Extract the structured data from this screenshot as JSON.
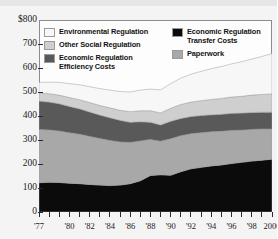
{
  "chart_data": {
    "type": "area",
    "title": "",
    "subtitle": "",
    "xlabel": "",
    "ylabel": "",
    "ylim": [
      0,
      800
    ],
    "ytick_labels": [
      "$800",
      "700",
      "600",
      "500",
      "400",
      "300",
      "200",
      "100",
      "0"
    ],
    "ytick_values": [
      800,
      700,
      600,
      500,
      400,
      300,
      200,
      100,
      0
    ],
    "grid": false,
    "stacked": true,
    "legend_position": "inside-top",
    "x": [
      1977,
      1978,
      1979,
      1980,
      1981,
      1982,
      1983,
      1984,
      1985,
      1986,
      1987,
      1988,
      1989,
      1990,
      1991,
      1992,
      1993,
      1994,
      1995,
      1996,
      1997,
      1998,
      1999,
      2000
    ],
    "xtick_labels": [
      "'77",
      "'80",
      "'82",
      "'84",
      "'86",
      "'88",
      "'90",
      "'92",
      "'94",
      "'96",
      "'98",
      "2000"
    ],
    "xtick_label_years": [
      1977,
      1980,
      1982,
      1984,
      1986,
      1988,
      1990,
      1992,
      1994,
      1996,
      1998,
      2000
    ],
    "series": [
      {
        "name": "Economic Regulation Transfer Costs",
        "color": "#0b0b0b",
        "values": [
          122,
          124,
          123,
          120,
          118,
          115,
          112,
          110,
          112,
          118,
          130,
          152,
          155,
          153,
          168,
          180,
          186,
          192,
          196,
          202,
          207,
          212,
          216,
          220
        ]
      },
      {
        "name": "Paperwork",
        "color": "#a8a8a8",
        "values": [
          222,
          218,
          214,
          210,
          206,
          200,
          194,
          188,
          180,
          172,
          166,
          150,
          140,
          152,
          150,
          146,
          144,
          142,
          140,
          138,
          134,
          132,
          130,
          126
        ]
      },
      {
        "name": "Economic Regulation Efficiency Costs",
        "color": "#595959",
        "values": [
          118,
          116,
          114,
          110,
          106,
          102,
          98,
          95,
          90,
          84,
          80,
          72,
          68,
          73,
          72,
          72,
          72,
          71,
          71,
          71,
          71,
          71,
          70,
          70
        ]
      },
      {
        "name": "Other Social Regulation",
        "color": "#cfcfcf",
        "values": [
          34,
          35,
          36,
          37,
          38,
          39,
          40,
          41,
          42,
          44,
          46,
          48,
          50,
          54,
          58,
          60,
          62,
          64,
          66,
          68,
          70,
          72,
          74,
          76
        ]
      },
      {
        "name": "Environmental Regulation",
        "color": "#f7f7f7",
        "values": [
          44,
          48,
          53,
          58,
          62,
          66,
          70,
          74,
          78,
          82,
          86,
          90,
          96,
          103,
          110,
          116,
          122,
          128,
          133,
          138,
          144,
          150,
          158,
          168
        ]
      }
    ],
    "totals_note": "",
    "legend": {
      "left_column": [
        {
          "label": "Environmental Regulation",
          "color": "#f7f7f7"
        },
        {
          "label": "Other Social Regulation",
          "color": "#cfcfcf"
        },
        {
          "label": "Economic Regulation",
          "label2": "Efficiency Costs",
          "color": "#595959"
        }
      ],
      "right_column": [
        {
          "label": "Economic Regulation",
          "label2": "Transfer Costs",
          "color": "#0b0b0b"
        },
        {
          "label": "Paperwork",
          "color": "#a8a8a8"
        }
      ]
    }
  },
  "colors": {
    "axis": "#2a2a2a",
    "frame": "#8c8c8c",
    "page_background": "#f4f4f4",
    "plot_background": "#fdfdfd",
    "text": "#1a1a1a"
  }
}
